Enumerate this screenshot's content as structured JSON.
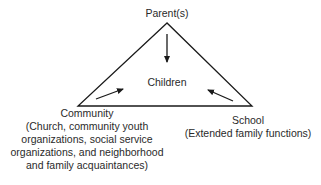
{
  "diagram": {
    "nodes": {
      "top": {
        "label": "Parent(s)"
      },
      "center": {
        "label": "Children"
      },
      "left": {
        "label": "Community",
        "detail_lines": [
          "(Church, community youth",
          "organizations, social service",
          "organizations, and neighborhood",
          "and family acquaintances)"
        ]
      },
      "right": {
        "label": "School",
        "detail_lines": [
          "(Extended family functions)"
        ]
      }
    },
    "edges": [
      {
        "from": "Parent(s)",
        "to": "Children"
      },
      {
        "from": "Community",
        "to": "Children"
      },
      {
        "from": "School",
        "to": "Children"
      }
    ],
    "colors": {
      "line": "#1a1a1a",
      "text": "#2a2a2a"
    }
  }
}
